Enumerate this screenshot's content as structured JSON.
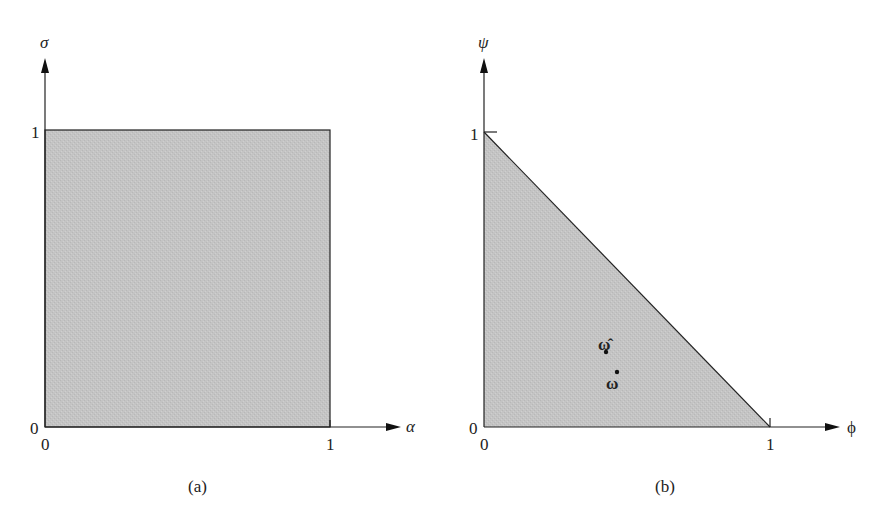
{
  "colors": {
    "region_fill": "#c4c4c4",
    "line": "#222222",
    "background": "#ffffff"
  },
  "panel_a": {
    "caption": "(a)",
    "x_axis_label": "α",
    "y_axis_label": "σ",
    "origin_x_label": "0",
    "origin_y_label": "0",
    "x_tick_label": "1",
    "y_tick_label": "1",
    "region": "unit square [0,1]×[0,1]"
  },
  "panel_b": {
    "caption": "(b)",
    "x_axis_label": "ϕ",
    "y_axis_label": "ψ",
    "origin_x_label": "0",
    "origin_y_label": "0",
    "x_tick_label": "1",
    "y_tick_label": "1",
    "region": "triangle ϕ+ψ ≤ 1",
    "points": [
      {
        "label": "ω̂",
        "name": "omega-hat"
      },
      {
        "label": "ω",
        "name": "omega"
      }
    ]
  }
}
